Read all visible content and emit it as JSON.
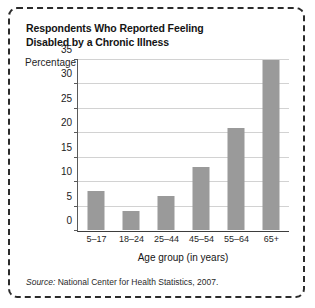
{
  "figure": {
    "title_line1": "Respondents Who Reported Feeling",
    "title_line2": "Disabled by a Chronic Illness",
    "source_prefix": "Source:",
    "source_text": "National Center for Health Statistics, 2007."
  },
  "colors": {
    "bar": "#9a9a9a",
    "gridline": "#d2d2d2",
    "axis": "#3d3d3d",
    "border": "#2b2b2b",
    "text": "#1a1a1a"
  },
  "chart_data": {
    "type": "bar",
    "title": "Respondents Who Reported Feeling Disabled by a Chronic Illness",
    "categories": [
      "5–17",
      "18–24",
      "25–44",
      "45–54",
      "55–64",
      "65+"
    ],
    "values": [
      8,
      4,
      7,
      13,
      21,
      35
    ],
    "xlabel": "Age group (in years)",
    "ylabel": "Percentage",
    "ylim": [
      0,
      35
    ],
    "yticks": [
      0,
      5,
      10,
      15,
      20,
      25,
      30,
      35
    ],
    "ytick_labels": [
      "0",
      "5",
      "10",
      "15",
      "20",
      "25",
      "30",
      "35"
    ],
    "grid": true,
    "legend": false,
    "source": "Source: National Center for Health Statistics, 2007."
  }
}
